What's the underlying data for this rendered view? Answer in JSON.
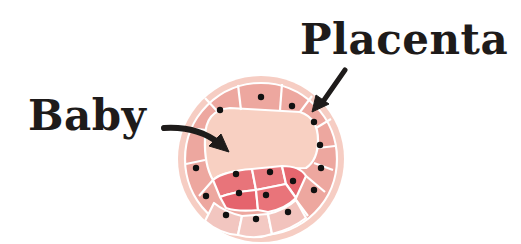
{
  "labels": {
    "placenta": "Placenta",
    "baby": "Baby"
  },
  "colors": {
    "outer_ring": "#f4c3b8",
    "cavity": "#f8cfc0",
    "trophoblast_cell": "#eea79f",
    "trophoblast_cell_light": "#f2c2bb",
    "inner_cell_mass": "#e9747a",
    "inner_cell_mass_dark": "#e5646d",
    "cell_border": "#ffffff",
    "nucleus": "#111111",
    "text": "#1e1b1a",
    "arrow": "#1e1b1a"
  },
  "diagram": {
    "type": "blastocyst",
    "center": [
      260,
      158
    ],
    "radius": 82,
    "arrows": [
      {
        "from": "Placenta",
        "to": "trophoblast outer cell layer"
      },
      {
        "from": "Baby",
        "to": "inner cell mass"
      }
    ]
  }
}
